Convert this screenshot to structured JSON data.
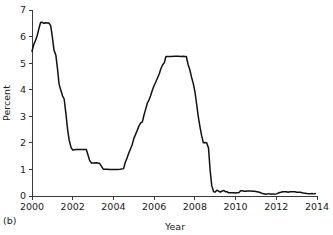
{
  "figure": {
    "panel_label": "(b)",
    "background_color": "#ffffff",
    "line_color": "#111111",
    "axis_color": "#3a3a3a"
  },
  "chart_data": {
    "type": "line",
    "title": "",
    "xlabel": "Year",
    "ylabel": "Percent",
    "xlim": [
      2000,
      2014
    ],
    "ylim": [
      0,
      7
    ],
    "grid": false,
    "legend": null,
    "x_ticks": [
      2000,
      2002,
      2004,
      2006,
      2008,
      2010,
      2012,
      2014
    ],
    "x_tick_labels": [
      "2000",
      "2002",
      "2004",
      "2006",
      "2008",
      "2010",
      "2012",
      "2014"
    ],
    "y_ticks": [
      0,
      1,
      2,
      3,
      4,
      5,
      6,
      7
    ],
    "y_tick_labels": [
      "0",
      "1",
      "2",
      "3",
      "4",
      "5",
      "6",
      "7"
    ],
    "series": [
      {
        "name": "Percent",
        "color": "#111111",
        "x": [
          2000.0,
          2000.08,
          2000.17,
          2000.25,
          2000.33,
          2000.42,
          2000.5,
          2000.58,
          2000.67,
          2000.75,
          2000.83,
          2000.92,
          2001.0,
          2001.08,
          2001.17,
          2001.25,
          2001.33,
          2001.42,
          2001.5,
          2001.58,
          2001.67,
          2001.75,
          2001.83,
          2001.92,
          2002.0,
          2002.17,
          2002.33,
          2002.5,
          2002.67,
          2002.83,
          2002.92,
          2003.0,
          2003.17,
          2003.33,
          2003.5,
          2003.67,
          2003.83,
          2004.0,
          2004.17,
          2004.33,
          2004.5,
          2004.58,
          2004.67,
          2004.75,
          2004.83,
          2004.92,
          2005.0,
          2005.17,
          2005.25,
          2005.33,
          2005.42,
          2005.5,
          2005.58,
          2005.67,
          2005.75,
          2005.83,
          2005.92,
          2006.0,
          2006.08,
          2006.17,
          2006.25,
          2006.33,
          2006.42,
          2006.5,
          2006.58,
          2006.67,
          2006.83,
          2007.0,
          2007.17,
          2007.33,
          2007.42,
          2007.5,
          2007.58,
          2007.67,
          2007.75,
          2007.83,
          2007.92,
          2008.0,
          2008.08,
          2008.17,
          2008.25,
          2008.33,
          2008.42,
          2008.5,
          2008.58,
          2008.67,
          2008.75,
          2008.83,
          2008.92,
          2009.0,
          2009.08,
          2009.17,
          2009.25,
          2009.33,
          2009.42,
          2009.5,
          2009.58,
          2009.67,
          2009.75,
          2009.83,
          2009.92,
          2010.0,
          2010.17,
          2010.25,
          2010.33,
          2010.42,
          2010.5,
          2010.58,
          2010.67,
          2010.75,
          2010.83,
          2010.92,
          2011.0,
          2011.17,
          2011.33,
          2011.5,
          2011.58,
          2011.67,
          2011.75,
          2011.83,
          2011.92,
          2012.0,
          2012.17,
          2012.33,
          2012.5,
          2012.58,
          2012.67,
          2012.75,
          2012.83,
          2012.92,
          2013.0,
          2013.17,
          2013.33,
          2013.5,
          2013.58,
          2013.67,
          2013.75,
          2013.83,
          2013.92
        ],
        "y": [
          5.45,
          5.68,
          5.85,
          6.02,
          6.27,
          6.53,
          6.54,
          6.5,
          6.52,
          6.51,
          6.51,
          6.4,
          5.98,
          5.49,
          5.31,
          4.8,
          4.21,
          3.97,
          3.77,
          3.65,
          3.07,
          2.49,
          2.09,
          1.82,
          1.73,
          1.75,
          1.75,
          1.75,
          1.75,
          1.34,
          1.24,
          1.24,
          1.25,
          1.22,
          1.01,
          1.01,
          1.0,
          1.0,
          1.0,
          1.01,
          1.03,
          1.26,
          1.43,
          1.61,
          1.76,
          1.93,
          2.16,
          2.47,
          2.63,
          2.74,
          2.79,
          3.04,
          3.26,
          3.5,
          3.62,
          3.78,
          4.0,
          4.16,
          4.29,
          4.45,
          4.59,
          4.79,
          4.94,
          5.02,
          5.25,
          5.25,
          5.25,
          5.26,
          5.26,
          5.25,
          5.26,
          5.25,
          5.25,
          4.94,
          4.76,
          4.49,
          4.24,
          3.94,
          3.5,
          2.98,
          2.61,
          2.28,
          2.0,
          2.01,
          2.0,
          1.81,
          0.97,
          0.39,
          0.16,
          0.15,
          0.22,
          0.18,
          0.15,
          0.18,
          0.21,
          0.16,
          0.16,
          0.12,
          0.12,
          0.12,
          0.12,
          0.11,
          0.13,
          0.2,
          0.2,
          0.18,
          0.18,
          0.19,
          0.19,
          0.19,
          0.18,
          0.18,
          0.17,
          0.14,
          0.09,
          0.07,
          0.08,
          0.08,
          0.07,
          0.08,
          0.07,
          0.08,
          0.13,
          0.16,
          0.16,
          0.14,
          0.16,
          0.16,
          0.16,
          0.16,
          0.14,
          0.14,
          0.11,
          0.09,
          0.08,
          0.08,
          0.09,
          0.08,
          0.09
        ]
      }
    ]
  }
}
